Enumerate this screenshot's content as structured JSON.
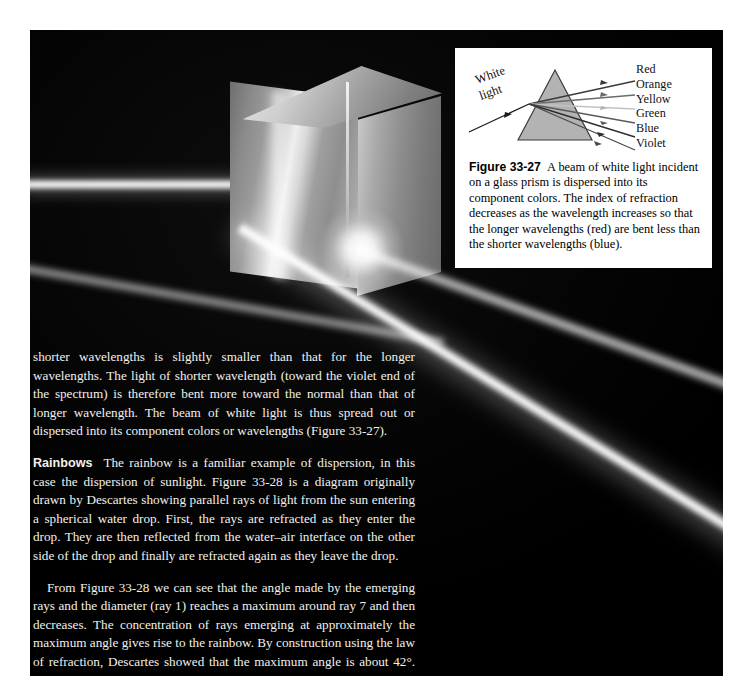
{
  "page": {
    "background_color": "#ffffff",
    "photo": {
      "description_name": "prism-dispersion-photograph",
      "background_color": "#050505",
      "beam_color": "#ffffff"
    }
  },
  "figure": {
    "number": "Figure 33-27",
    "caption": "A beam of white light incident on a glass prism is dispersed into its component colors. The index of refraction decreases as the wavelength increases so that the longer wavelengths (red) are bent less than the shorter wavelengths (blue).",
    "incident_label_line1": "White",
    "incident_label_line2": "light",
    "prism_fill": "#b3b3b3",
    "prism_stroke": "#333333",
    "rays": [
      {
        "label": "Red",
        "tone": "#3a3a3a"
      },
      {
        "label": "Orange",
        "tone": "#6b6b6b"
      },
      {
        "label": "Yellow",
        "tone": "#c2c2c2"
      },
      {
        "label": "Green",
        "tone": "#5a5a5a"
      },
      {
        "label": "Blue",
        "tone": "#2e2e2e"
      },
      {
        "label": "Violet",
        "tone": "#4a4a4a"
      }
    ]
  },
  "body": {
    "paragraph_1": "shorter wavelengths is slightly smaller than that for the longer wavelengths. The light of shorter wavelength (toward the violet end of the spectrum) is therefore bent more toward the normal than that of longer wavelength. The beam of white light is thus spread out or dispersed into its component colors or wavelengths (Figure 33-27).",
    "paragraph_2_runhead": "Rainbows",
    "paragraph_2": "The rainbow is a familiar example of dispersion, in this case the dispersion of sunlight. Figure 33-28 is a diagram originally drawn by Descartes showing parallel rays of light from the sun entering a spherical water drop. First, the rays are refracted as they enter the drop. They are then reflected from the water–air interface on the other side of the drop and finally are refracted again as they leave the drop.",
    "paragraph_3": "From Figure 33-28 we can see that the angle made by the emerging rays and the diameter (ray 1) reaches a maximum around ray 7 and then decreases. The concentration of rays emerging at approximately the maximum angle gives rise to the rainbow. By construction using the law of refraction, Descartes showed that the maximum angle is about 42°. To observe a rain-"
  }
}
